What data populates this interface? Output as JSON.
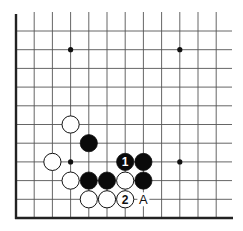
{
  "diagram": {
    "type": "go-board-fragment",
    "grid": {
      "origin_x": 16,
      "origin_y": 31,
      "col_spacing": 18.2,
      "row_spacing": 18.7,
      "cols": 12,
      "rows": 11,
      "left_edge": true,
      "bottom_edge": true,
      "line_color": "#555555",
      "edge_color": "#222222"
    },
    "star_points": [
      {
        "col": 3,
        "row": 1
      },
      {
        "col": 9,
        "row": 1
      },
      {
        "col": 3,
        "row": 7
      },
      {
        "col": 9,
        "row": 7
      }
    ],
    "stones": [
      {
        "col": 3,
        "row": 5,
        "color": "white",
        "label": ""
      },
      {
        "col": 4,
        "row": 6,
        "color": "black",
        "label": ""
      },
      {
        "col": 2,
        "row": 7,
        "color": "white",
        "label": ""
      },
      {
        "col": 6,
        "row": 7,
        "color": "black",
        "label": "1"
      },
      {
        "col": 7,
        "row": 7,
        "color": "black",
        "label": ""
      },
      {
        "col": 3,
        "row": 8,
        "color": "white",
        "label": ""
      },
      {
        "col": 4,
        "row": 8,
        "color": "black",
        "label": ""
      },
      {
        "col": 5,
        "row": 8,
        "color": "black",
        "label": ""
      },
      {
        "col": 6,
        "row": 8,
        "color": "white",
        "label": ""
      },
      {
        "col": 7,
        "row": 8,
        "color": "black",
        "label": ""
      },
      {
        "col": 4,
        "row": 9,
        "color": "white",
        "label": ""
      },
      {
        "col": 5,
        "row": 9,
        "color": "white",
        "label": ""
      },
      {
        "col": 6,
        "row": 9,
        "color": "white",
        "label": "2"
      }
    ],
    "point_labels": [
      {
        "col": 7,
        "row": 9,
        "text": "A"
      }
    ]
  }
}
